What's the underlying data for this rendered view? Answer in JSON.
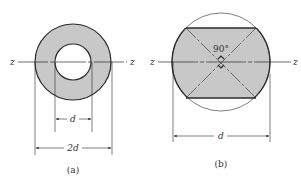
{
  "figures": [
    {
      "id": "a",
      "caption": "(a)",
      "shape": "hollow circular cross-section (annulus)",
      "axis_label_left": "z",
      "axis_label_right": "z",
      "inner_dimension_label": "d",
      "outer_dimension_label": "2d"
    },
    {
      "id": "b",
      "caption": "(b)",
      "shape": "circular cross-section with top and bottom segments removed",
      "axis_label_left": "z",
      "axis_label_right": "z",
      "angle_label": "90°",
      "dimension_label": "d"
    }
  ],
  "colors": {
    "fill": "#c8c8c8",
    "stroke": "#2a2a2a",
    "background": "#ffffff"
  }
}
